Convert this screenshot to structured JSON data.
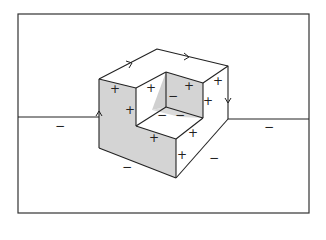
{
  "figure": {
    "colors": {
      "line": "#222222",
      "shade": "#d4d4d4",
      "shadow": "#c8c8c8",
      "background": "#ffffff"
    },
    "frame": {
      "x": 18,
      "y": 14,
      "w": 291,
      "h": 199
    }
  },
  "labels": [
    {
      "text": "+",
      "x": 115,
      "y": 89
    },
    {
      "text": "+",
      "x": 130,
      "y": 110
    },
    {
      "text": "+",
      "x": 151,
      "y": 88
    },
    {
      "text": "−",
      "x": 173,
      "y": 96
    },
    {
      "text": "+",
      "x": 189,
      "y": 86
    },
    {
      "text": "+",
      "x": 218,
      "y": 81
    },
    {
      "text": "+",
      "x": 208,
      "y": 101
    },
    {
      "text": "−",
      "x": 162,
      "y": 115
    },
    {
      "text": "−",
      "x": 180,
      "y": 115
    },
    {
      "text": "+",
      "x": 193,
      "y": 133
    },
    {
      "text": "+",
      "x": 154,
      "y": 138
    },
    {
      "text": "+",
      "x": 182,
      "y": 155
    },
    {
      "text": "−",
      "x": 214,
      "y": 158
    },
    {
      "text": "−",
      "x": 127,
      "y": 167
    },
    {
      "text": "−",
      "x": 60,
      "y": 126
    },
    {
      "text": "−",
      "x": 269,
      "y": 127
    }
  ]
}
